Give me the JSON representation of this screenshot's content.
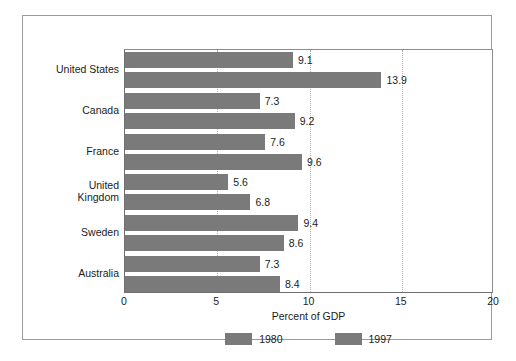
{
  "chart_data": {
    "type": "bar",
    "orientation": "horizontal",
    "title": "",
    "xlabel": "Percent of GDP",
    "ylabel": "",
    "xlim": [
      0,
      20
    ],
    "xticks": [
      0,
      5,
      10,
      15,
      20
    ],
    "xtick_labels": [
      "0",
      "5",
      "10",
      "15",
      "20"
    ],
    "grid": "vertical-dotted",
    "legend_position": "bottom-center",
    "categories": [
      "United States",
      "Canada",
      "France",
      "United\nKingdom",
      "Sweden",
      "Australia"
    ],
    "series": [
      {
        "name": "1980",
        "color": "#7a7a7a",
        "values": [
          9.1,
          7.3,
          7.6,
          5.6,
          9.4,
          7.3
        ],
        "labels": [
          "9.1",
          "7.3",
          "7.6",
          "5.6",
          "9.4",
          "7.3"
        ]
      },
      {
        "name": "1997",
        "color": "#7a7a7a",
        "values": [
          13.9,
          9.2,
          9.6,
          6.8,
          8.6,
          8.4
        ],
        "labels": [
          "13.9",
          "9.2",
          "9.6",
          "6.8",
          "8.6",
          "8.4"
        ]
      }
    ]
  },
  "legend": {
    "items": [
      {
        "label": "1980",
        "color": "#7a7a7a"
      },
      {
        "label": "1997",
        "color": "#7a7a7a"
      }
    ]
  },
  "axis": {
    "x_title": "Percent of GDP",
    "ticks": [
      "0",
      "5",
      "10",
      "15",
      "20"
    ]
  },
  "categories": [
    {
      "line1": "United States",
      "line2": ""
    },
    {
      "line1": "Canada",
      "line2": ""
    },
    {
      "line1": "France",
      "line2": ""
    },
    {
      "line1": "United",
      "line2": "Kingdom"
    },
    {
      "line1": "Sweden",
      "line2": ""
    },
    {
      "line1": "Australia",
      "line2": ""
    }
  ],
  "colors": {
    "bar": "#7a7a7a",
    "frame": "#9a9a9a",
    "axis": "#6f6f6f",
    "grid": "#b3b3b3",
    "text": "#1b1b1b"
  }
}
